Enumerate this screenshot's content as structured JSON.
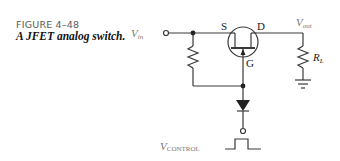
{
  "figure": {
    "number": "FIGURE 4–48",
    "title": "A JFET analog switch."
  },
  "circuit": {
    "input_label_main": "V",
    "input_label_sub": "in",
    "output_label_main": "V",
    "output_label_sub": "out",
    "source_label": "S",
    "drain_label": "D",
    "gate_label": "G",
    "load_label_main": "R",
    "load_label_sub": "L",
    "control_label_main": "V",
    "control_label_sub": "CONTROL",
    "line_color": "#3a3a3a"
  }
}
